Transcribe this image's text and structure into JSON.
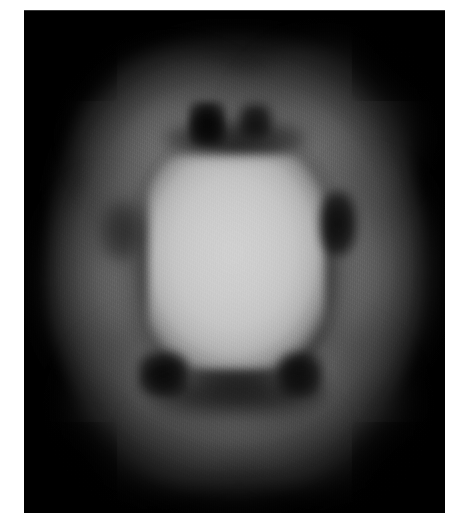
{
  "page": {
    "width_px": 456,
    "height_px": 531,
    "background_color": "#ffffff",
    "margin_description": "white page border surrounding the scan plate"
  },
  "scan": {
    "title": "",
    "modality_appearance": "grayscale tomographic cross-section",
    "frame": {
      "x_px": 24,
      "y_px": 10,
      "width_px": 421,
      "height_px": 503,
      "background_color": "#000000"
    },
    "colors": {
      "background": "#000000",
      "outer_tissue": "#3a3a3a",
      "ring_bright": "#686868",
      "ring_peak": "#767676",
      "core_bright": "#c8c8c8",
      "core_peak": "#d2d2d2",
      "defect_dark": "#060606"
    },
    "structures": [
      {
        "name": "body-halo",
        "label": "outer diffuse soft-tissue halo",
        "intensity": "low",
        "gray_hex": "#3a3a3a"
      },
      {
        "name": "tissue-ring",
        "label": "bright annular uptake ring",
        "intensity": "medium",
        "gray_hex": "#686868"
      },
      {
        "name": "bright-core",
        "label": "central high-intensity rounded-square core",
        "intensity": "high",
        "gray_hex": "#c8c8c8"
      },
      {
        "name": "core-dark-annulus",
        "label": "dark annulus separating core from ring",
        "intensity": "very low",
        "gray_hex": "#101010"
      }
    ],
    "focal_defects": [
      {
        "name": "dark-spot-superior-left",
        "label": "superior-left focal photopenic defect",
        "gray_hex": "#040404"
      },
      {
        "name": "dark-spot-superior-right",
        "label": "superior-right focal photopenic defect",
        "gray_hex": "#0a0a0a"
      },
      {
        "name": "dark-spot-superior-band",
        "label": "superior dark band",
        "gray_hex": "#121212"
      },
      {
        "name": "dark-spot-lateral-right",
        "label": "right lateral focal defect",
        "gray_hex": "#0c0c0c"
      },
      {
        "name": "dark-spot-inferior-left",
        "label": "inferior-left focal defect",
        "gray_hex": "#060606"
      },
      {
        "name": "dark-spot-inferior-right",
        "label": "inferior-right focal defect",
        "gray_hex": "#080808"
      },
      {
        "name": "dark-spot-inferior-band",
        "label": "inferior dark band",
        "gray_hex": "#141414"
      },
      {
        "name": "dark-spot-septal-left",
        "label": "left septal low-intensity region",
        "gray_hex": "#1c1c1c"
      }
    ]
  },
  "chart_data": {
    "type": "heatmap",
    "title": "",
    "xlabel": "",
    "ylabel": "",
    "colormap": "grayscale",
    "value_range": [
      0,
      255
    ],
    "radial_profile": {
      "radius_fraction": [
        0.0,
        0.1,
        0.2,
        0.3,
        0.38,
        0.45,
        0.52,
        0.6,
        0.7,
        0.8,
        0.9,
        1.0
      ],
      "mean_gray_value": [
        205,
        203,
        198,
        170,
        95,
        45,
        72,
        104,
        92,
        58,
        22,
        4
      ]
    },
    "angular_defects_deg": [
      {
        "angle": 78,
        "mean_gray_value": 6
      },
      {
        "angle": 100,
        "mean_gray_value": 12
      },
      {
        "angle": 10,
        "mean_gray_value": 14
      },
      {
        "angle": 250,
        "mean_gray_value": 8
      },
      {
        "angle": 290,
        "mean_gray_value": 10
      }
    ]
  }
}
